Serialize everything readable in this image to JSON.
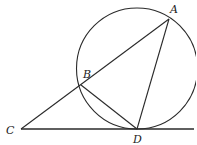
{
  "diagram": {
    "type": "geometry",
    "points": {
      "A": {
        "label": "A",
        "x": 169,
        "y": 19,
        "label_x": 170,
        "label_y": 13
      },
      "B": {
        "label": "B",
        "x": 81,
        "y": 85,
        "label_x": 83,
        "label_y": 78
      },
      "C": {
        "label": "C",
        "x": 21,
        "y": 129,
        "label_x": 6,
        "label_y": 134
      },
      "D": {
        "label": "D",
        "x": 137,
        "y": 129,
        "label_x": 133,
        "label_y": 143
      }
    },
    "circle": {
      "cx": 137,
      "cy": 68.5,
      "r": 60.5
    },
    "segments": [
      {
        "name": "CA",
        "from": "C",
        "to": "A"
      },
      {
        "name": "CD-line",
        "from": "C",
        "to": "E"
      },
      {
        "name": "BD",
        "from": "B",
        "to": "D"
      },
      {
        "name": "AD",
        "from": "A",
        "to": "D"
      }
    ],
    "line_end": {
      "x": 194,
      "y": 129
    },
    "colors": {
      "stroke": "#2a2a2a",
      "background": "#ffffff"
    }
  }
}
